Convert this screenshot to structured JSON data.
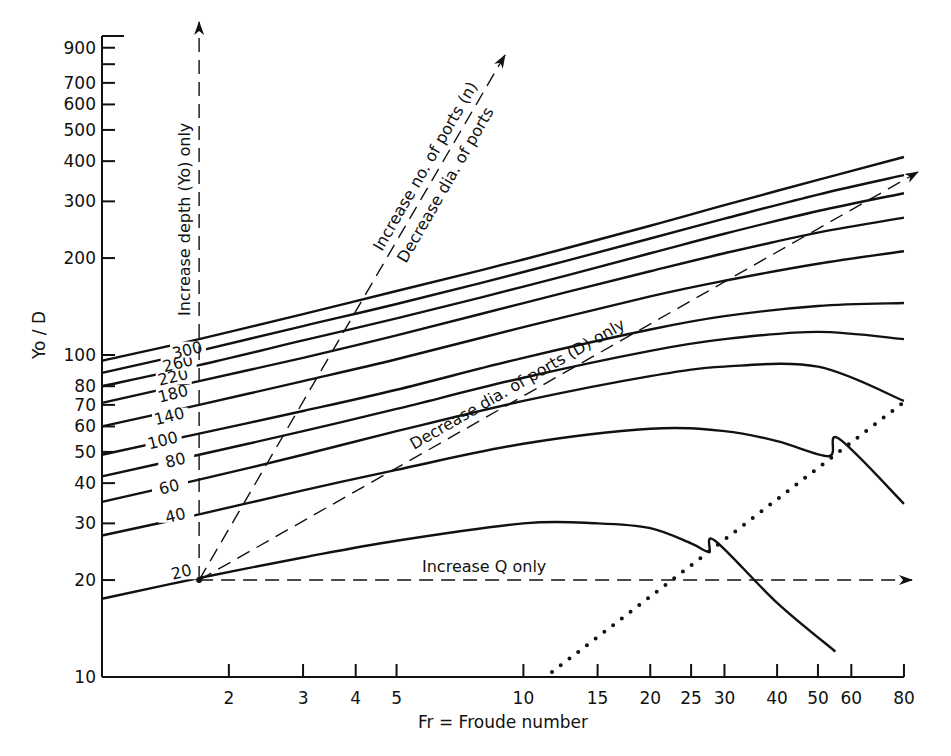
{
  "chart_data": {
    "type": "line",
    "title": "",
    "xlabel": "Fr = Froude number",
    "ylabel": "Yo / D",
    "xscale": "log",
    "yscale": "log",
    "xlim": [
      1,
      80
    ],
    "ylim": [
      10,
      1000
    ],
    "grid": false,
    "x_ticks": [
      2,
      3,
      4,
      5,
      10,
      15,
      20,
      25,
      30,
      40,
      50,
      60,
      80
    ],
    "y_ticks": [
      10,
      20,
      30,
      40,
      50,
      60,
      70,
      80,
      100,
      200,
      300,
      400,
      500,
      600,
      700,
      800,
      900
    ],
    "y_tick_labels": [
      "10",
      "20",
      "30",
      "40",
      "50",
      "60",
      "70",
      "80",
      "100",
      "200",
      "300",
      "400",
      "500",
      "600",
      "700",
      "",
      "900"
    ],
    "series": [
      {
        "name": "20",
        "points": [
          [
            1,
            17.5
          ],
          [
            1.7,
            20.3
          ],
          [
            3,
            23.5
          ],
          [
            5,
            26.5
          ],
          [
            10,
            30
          ],
          [
            15,
            30
          ],
          [
            20,
            29
          ],
          [
            25,
            26
          ],
          [
            27.5,
            24.5
          ],
          [
            28.5,
            26.5
          ],
          [
            40,
            17
          ],
          [
            55,
            12
          ]
        ]
      },
      {
        "name": "40",
        "points": [
          [
            1,
            27.5
          ],
          [
            1.7,
            32
          ],
          [
            3,
            38
          ],
          [
            5,
            44
          ],
          [
            10,
            53
          ],
          [
            20,
            59
          ],
          [
            30,
            58
          ],
          [
            40,
            54
          ],
          [
            53,
            48.5
          ],
          [
            56,
            55
          ],
          [
            80,
            34.5
          ]
        ]
      },
      {
        "name": "60",
        "points": [
          [
            1,
            35
          ],
          [
            1.7,
            41
          ],
          [
            3,
            49
          ],
          [
            5,
            58
          ],
          [
            10,
            72
          ],
          [
            20,
            86
          ],
          [
            30,
            92
          ],
          [
            50,
            92
          ],
          [
            80,
            72
          ]
        ]
      },
      {
        "name": "80",
        "points": [
          [
            1,
            42
          ],
          [
            1.7,
            49
          ],
          [
            3,
            58
          ],
          [
            5,
            68
          ],
          [
            10,
            85
          ],
          [
            20,
            103
          ],
          [
            30,
            112
          ],
          [
            50,
            118
          ],
          [
            80,
            112
          ]
        ]
      },
      {
        "name": "100",
        "points": [
          [
            1,
            49
          ],
          [
            1.7,
            57
          ],
          [
            3,
            67
          ],
          [
            5,
            78
          ],
          [
            10,
            98
          ],
          [
            20,
            120
          ],
          [
            30,
            132
          ],
          [
            50,
            142
          ],
          [
            80,
            145
          ]
        ]
      },
      {
        "name": "140",
        "points": [
          [
            1,
            60
          ],
          [
            1.7,
            70
          ],
          [
            3,
            83
          ],
          [
            5,
            97
          ],
          [
            10,
            122
          ],
          [
            20,
            152
          ],
          [
            30,
            170
          ],
          [
            50,
            192
          ],
          [
            80,
            210
          ]
        ]
      },
      {
        "name": "180",
        "points": [
          [
            1,
            71
          ],
          [
            1.7,
            83
          ],
          [
            3,
            98
          ],
          [
            5,
            115
          ],
          [
            10,
            145
          ],
          [
            20,
            182
          ],
          [
            30,
            207
          ],
          [
            50,
            240
          ],
          [
            80,
            267
          ]
        ]
      },
      {
        "name": "220",
        "points": [
          [
            1,
            80
          ],
          [
            1.7,
            93
          ],
          [
            3,
            111
          ],
          [
            5,
            130
          ],
          [
            10,
            163
          ],
          [
            20,
            207
          ],
          [
            30,
            238
          ],
          [
            50,
            280
          ],
          [
            80,
            318
          ]
        ]
      },
      {
        "name": "260",
        "points": [
          [
            1,
            88
          ],
          [
            1.7,
            103
          ],
          [
            3,
            123
          ],
          [
            5,
            144
          ],
          [
            10,
            181
          ],
          [
            20,
            230
          ],
          [
            30,
            265
          ],
          [
            50,
            315
          ],
          [
            80,
            362
          ]
        ]
      },
      {
        "name": "300",
        "points": [
          [
            1,
            96
          ],
          [
            1.7,
            112
          ],
          [
            3,
            134
          ],
          [
            5,
            158
          ],
          [
            10,
            198
          ],
          [
            20,
            252
          ],
          [
            30,
            292
          ],
          [
            50,
            350
          ],
          [
            80,
            412
          ]
        ]
      }
    ],
    "annotations": [
      {
        "text": "Increase depth (Yo) only",
        "type": "dashed-arrow",
        "from": [
          1.7,
          20
        ],
        "to": [
          1.7,
          1000
        ]
      },
      {
        "text": "Increase no. of ports (n)",
        "type": "dashed-arrow",
        "from": [
          1.7,
          20
        ],
        "to": [
          12,
          850
        ]
      },
      {
        "text": "Decrease dia. of ports",
        "type": "label"
      },
      {
        "text": "Decrease dia. of ports (D) only",
        "type": "dashed-arrow",
        "from": [
          1.7,
          20
        ],
        "to": [
          80,
          350
        ]
      },
      {
        "text": "Increase Q only",
        "type": "dashed-arrow",
        "from": [
          1.7,
          20
        ],
        "to": [
          80,
          20
        ]
      },
      {
        "text": "",
        "type": "dotted-line",
        "from": [
          12,
          10
        ],
        "to": [
          80,
          70
        ]
      }
    ]
  },
  "axes": {
    "x_title": "Fr = Froude number",
    "y_title": "Yo / D"
  },
  "labels": {
    "yo_only": "Increase depth (Yo) only",
    "n_ports": "Increase no. of ports (n)",
    "dec_dia": "Decrease dia. of ports",
    "dec_d_only": "Decrease dia. of ports (D) only",
    "q_only": "Increase Q only"
  }
}
